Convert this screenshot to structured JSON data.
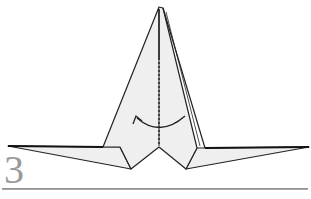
{
  "diagram": {
    "step_number": "3",
    "paper_color": "#f0f0f0",
    "line_color": "#222222",
    "step_number_color": "#9a9a9a",
    "annotations": [
      {
        "type": "valley-fold-line",
        "orientation": "vertical",
        "description": "dashed center crease"
      },
      {
        "type": "fold-arrow",
        "direction": "right-to-left",
        "description": "curved arrow indicating fold over"
      }
    ]
  }
}
